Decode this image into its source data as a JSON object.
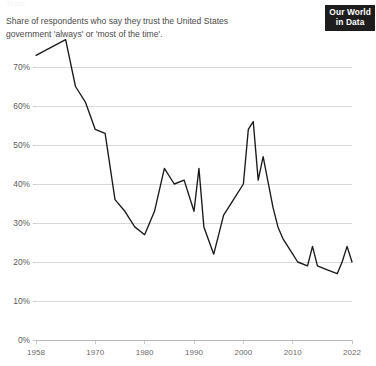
{
  "header": {
    "clipped_title": "Trust",
    "subtitle": "Share of respondents who say they trust the United States government 'always' or 'most of the time'.",
    "logo_line1": "Our World",
    "logo_line2": "in Data"
  },
  "colors": {
    "line": "#1a1a1a",
    "grid": "#d8d8d8",
    "axis": "#b9b9b9",
    "text": "#4a4a4a",
    "logo_bg": "#1d1d1d",
    "logo_fg": "#ffffff",
    "background": "#ffffff"
  },
  "chart_data": {
    "type": "line",
    "title": "Trust",
    "subtitle": "Share of respondents who say they trust the United States government 'always' or 'most of the time'.",
    "xlabel": "",
    "ylabel": "",
    "xlim": [
      1958,
      2022
    ],
    "ylim": [
      0,
      70
    ],
    "grid": true,
    "legend": false,
    "y_ticks": [
      0,
      10,
      20,
      30,
      40,
      50,
      60,
      70
    ],
    "y_tick_labels": [
      "0%",
      "10%",
      "20%",
      "30%",
      "40%",
      "50%",
      "60%",
      "70%"
    ],
    "x_ticks": [
      1958,
      1970,
      1980,
      1990,
      2000,
      2010,
      2022
    ],
    "x_tick_labels": [
      "1958",
      "1970",
      "1980",
      "1990",
      "2000",
      "2010",
      "2022"
    ],
    "series": [
      {
        "name": "Trust in US federal government",
        "x": [
          1958,
          1964,
          1966,
          1968,
          1970,
          1972,
          1974,
          1976,
          1978,
          1980,
          1982,
          1984,
          1986,
          1988,
          1990,
          1991,
          1992,
          1994,
          1996,
          1998,
          2000,
          2001,
          2002,
          2003,
          2004,
          2006,
          2007,
          2008,
          2010,
          2011,
          2013,
          2014,
          2015,
          2017,
          2019,
          2020,
          2021,
          2022
        ],
        "y": [
          73,
          77,
          65,
          61,
          54,
          53,
          36,
          33,
          29,
          27,
          33,
          44,
          40,
          41,
          33,
          44,
          29,
          22,
          32,
          36,
          40,
          54,
          56,
          41,
          47,
          34,
          29,
          26,
          22,
          20,
          19,
          24,
          19,
          18,
          17,
          20,
          24,
          20
        ]
      }
    ]
  }
}
